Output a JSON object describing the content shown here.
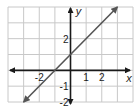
{
  "chart_data": {
    "type": "line",
    "title": "",
    "xlabel": "x",
    "ylabel": "y",
    "xlim": [
      -4,
      4
    ],
    "ylim": [
      -2,
      4
    ],
    "grid": true,
    "grid_step": 1,
    "x_ticks": [
      {
        "value": -2,
        "label": "-2"
      },
      {
        "value": 1,
        "label": "1"
      },
      {
        "value": 2,
        "label": "2"
      }
    ],
    "y_ticks": [
      {
        "value": 2,
        "label": "2"
      },
      {
        "value": -1,
        "label": "-1"
      },
      {
        "value": -2,
        "label": "-2"
      }
    ],
    "series": [
      {
        "name": "y = x + 1",
        "points": [
          [
            -3,
            -2
          ],
          [
            -1,
            0
          ],
          [
            0,
            1
          ],
          [
            3,
            4
          ]
        ],
        "slope": 1,
        "intercept": 1,
        "arrows": "both"
      }
    ]
  },
  "colors": {
    "grid": "#c8c8c8",
    "axis": "#1a1a1a",
    "line": "#555555",
    "text": "#1a1a1a"
  }
}
